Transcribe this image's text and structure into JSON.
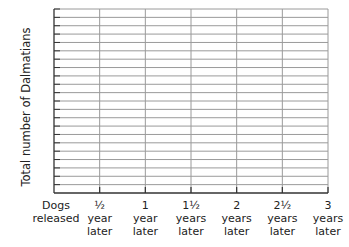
{
  "chart_data": {
    "type": "line",
    "title": "",
    "xlabel": "",
    "ylabel": "Total number of Dalmatians",
    "x_ticks": [
      {
        "value": 0,
        "lines": [
          "Dogs",
          "released"
        ]
      },
      {
        "value": 0.5,
        "lines": [
          "½",
          "year",
          "later"
        ]
      },
      {
        "value": 1,
        "lines": [
          "1",
          "year",
          "later"
        ]
      },
      {
        "value": 1.5,
        "lines": [
          "1½",
          "years",
          "later"
        ]
      },
      {
        "value": 2,
        "lines": [
          "2",
          "years",
          "later"
        ]
      },
      {
        "value": 2.5,
        "lines": [
          "2½",
          "years",
          "later"
        ]
      },
      {
        "value": 3,
        "lines": [
          "3",
          "years",
          "later"
        ]
      }
    ],
    "xlim": [
      0,
      3
    ],
    "y_gridline_count": 22,
    "y_tick_labels": [],
    "grid": true,
    "series": [],
    "legend": "none"
  },
  "colors": {
    "grid": "#9a9a9a",
    "axis": "#333333",
    "text": "#222222"
  }
}
